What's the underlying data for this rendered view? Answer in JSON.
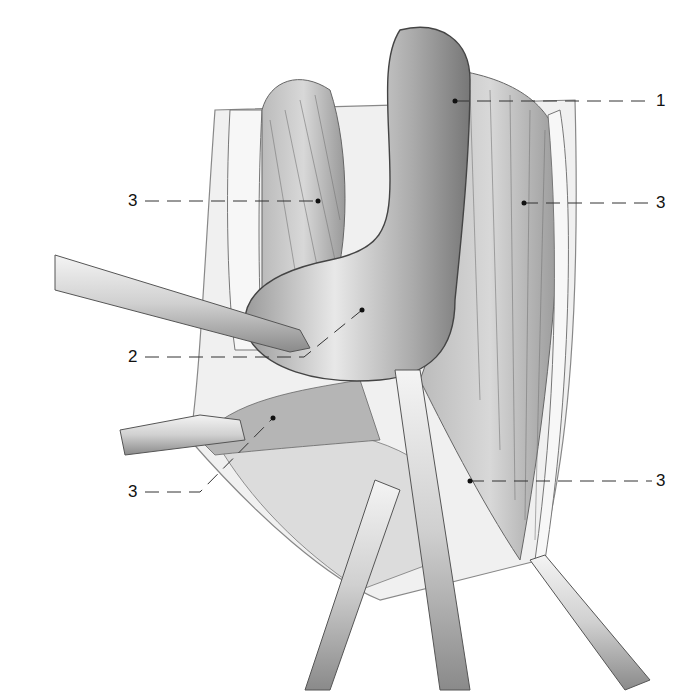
{
  "figure": {
    "type": "surgical-anatomy-illustration",
    "labels": [
      {
        "id": "l1",
        "text": "1",
        "x": 660,
        "y": 92,
        "point": [
          455,
          101
        ]
      },
      {
        "id": "l3a",
        "text": "3",
        "x": 128,
        "y": 193,
        "point": [
          318,
          201
        ]
      },
      {
        "id": "l3b",
        "text": "3",
        "x": 660,
        "y": 194,
        "point": [
          524,
          203
        ]
      },
      {
        "id": "l2",
        "text": "2",
        "x": 128,
        "y": 350,
        "point": [
          362,
          310
        ]
      },
      {
        "id": "l3c",
        "text": "3",
        "x": 128,
        "y": 485,
        "point": [
          273,
          418
        ]
      },
      {
        "id": "l3d",
        "text": "3",
        "x": 660,
        "y": 472,
        "point": [
          470,
          481
        ]
      }
    ]
  }
}
